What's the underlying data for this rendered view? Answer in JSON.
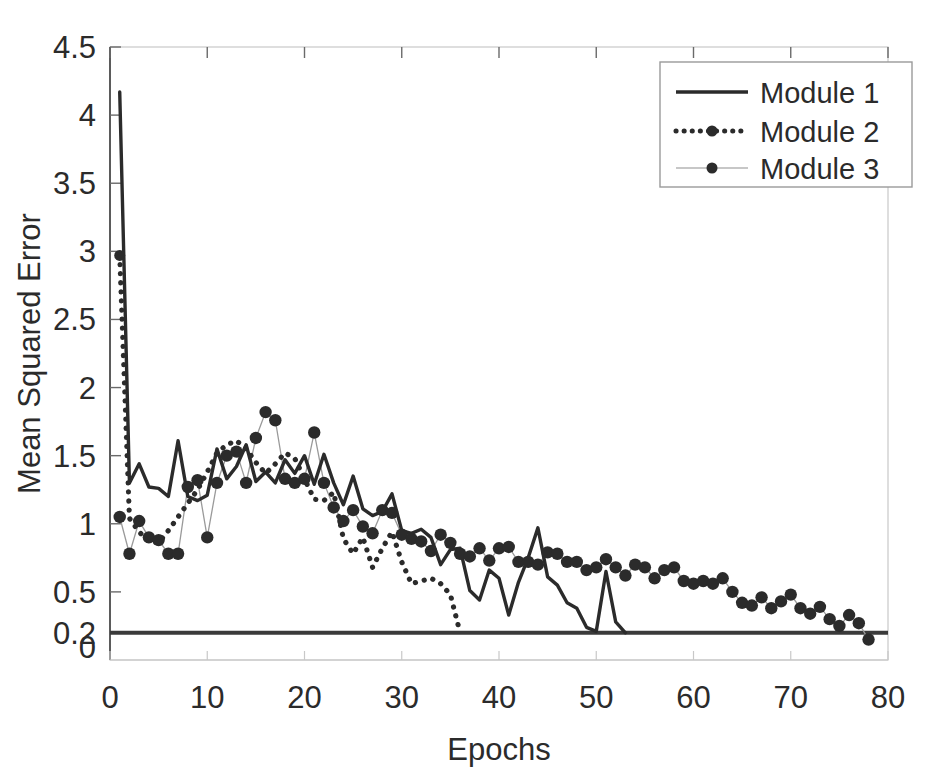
{
  "chart_data": {
    "type": "line",
    "title": "",
    "xlabel": "Epochs",
    "ylabel": "Mean Squared Error",
    "xlim": [
      0,
      80
    ],
    "ylim": [
      0,
      4.5
    ],
    "xticks": [
      0,
      10,
      20,
      30,
      40,
      50,
      60,
      70,
      80
    ],
    "xticklabels": [
      "0",
      "10",
      "20",
      "30",
      "40",
      "50",
      "60",
      "70",
      "80"
    ],
    "yticks": [
      0,
      0.2,
      0.5,
      1,
      1.5,
      2,
      2.5,
      3,
      3.5,
      4,
      4.5
    ],
    "yticklabels": [
      "0",
      "0.2",
      "0.5",
      "1",
      "1.5",
      "2",
      "2.5",
      "3",
      "3.5",
      "4",
      "4.5"
    ],
    "grid": false,
    "legend_position": "top-right",
    "goal_line": 0.2,
    "series": [
      {
        "name": "Module 1",
        "style": "solid",
        "marker": "none",
        "color": "#2b2b2b",
        "x": [
          1,
          2,
          3,
          4,
          5,
          6,
          7,
          8,
          9,
          10,
          11,
          12,
          13,
          14,
          15,
          16,
          17,
          18,
          19,
          20,
          21,
          22,
          23,
          24,
          25,
          26,
          27,
          28,
          29,
          30,
          31,
          32,
          33,
          34,
          35,
          36,
          37,
          38,
          39,
          40,
          41,
          42,
          43,
          44,
          45,
          46,
          47,
          48,
          49,
          50,
          51,
          52,
          53
        ],
        "values": [
          4.17,
          1.3,
          1.44,
          1.27,
          1.26,
          1.2,
          1.61,
          1.2,
          1.17,
          1.21,
          1.55,
          1.33,
          1.42,
          1.58,
          1.31,
          1.38,
          1.3,
          1.47,
          1.37,
          1.5,
          1.29,
          1.51,
          1.3,
          1.14,
          1.35,
          1.11,
          1.06,
          1.09,
          1.22,
          0.95,
          0.93,
          0.96,
          0.9,
          0.7,
          0.81,
          0.82,
          0.51,
          0.44,
          0.66,
          0.6,
          0.33,
          0.57,
          0.75,
          0.97,
          0.61,
          0.55,
          0.42,
          0.38,
          0.24,
          0.21,
          0.65,
          0.28,
          0.2
        ]
      },
      {
        "name": "Module 2",
        "style": "dotted",
        "marker": "dot",
        "color": "#2b2b2b",
        "x": [
          1,
          2,
          3,
          4,
          5,
          6,
          7,
          8,
          9,
          10,
          11,
          12,
          13,
          14,
          15,
          16,
          17,
          18,
          19,
          20,
          21,
          22,
          23,
          24,
          25,
          26,
          27,
          28,
          29,
          30,
          31,
          32,
          33,
          34,
          35,
          36
        ],
        "values": [
          2.97,
          1.04,
          0.94,
          0.87,
          0.86,
          0.95,
          1.05,
          1.15,
          1.25,
          1.38,
          1.52,
          1.58,
          1.61,
          1.55,
          1.45,
          1.37,
          1.44,
          1.52,
          1.48,
          1.33,
          1.18,
          1.17,
          1.23,
          0.89,
          0.78,
          0.9,
          0.68,
          0.82,
          0.94,
          0.72,
          0.56,
          0.58,
          0.6,
          0.56,
          0.48,
          0.2
        ]
      },
      {
        "name": "Module 3",
        "style": "markers",
        "marker": "dot",
        "color": "#2b2b2b",
        "x": [
          1,
          2,
          3,
          4,
          5,
          6,
          7,
          8,
          9,
          10,
          11,
          12,
          13,
          14,
          15,
          16,
          17,
          18,
          19,
          20,
          21,
          22,
          23,
          24,
          25,
          26,
          27,
          28,
          29,
          30,
          31,
          32,
          33,
          34,
          35,
          36,
          37,
          38,
          39,
          40,
          41,
          42,
          43,
          44,
          45,
          46,
          47,
          48,
          49,
          50,
          51,
          52,
          53,
          54,
          55,
          56,
          57,
          58,
          59,
          60,
          61,
          62,
          63,
          64,
          65,
          66,
          67,
          68,
          69,
          70,
          71,
          72,
          73,
          74,
          75,
          76,
          77,
          78
        ],
        "values": [
          1.05,
          0.78,
          1.02,
          0.9,
          0.88,
          0.78,
          0.78,
          1.27,
          1.32,
          0.9,
          1.3,
          1.5,
          1.53,
          1.3,
          1.63,
          1.82,
          1.76,
          1.33,
          1.3,
          1.33,
          1.67,
          1.3,
          1.12,
          1.02,
          1.1,
          0.98,
          0.93,
          1.1,
          1.08,
          0.92,
          0.89,
          0.87,
          0.8,
          0.92,
          0.86,
          0.78,
          0.76,
          0.82,
          0.73,
          0.82,
          0.83,
          0.72,
          0.72,
          0.7,
          0.79,
          0.78,
          0.72,
          0.72,
          0.66,
          0.68,
          0.74,
          0.68,
          0.62,
          0.7,
          0.68,
          0.6,
          0.66,
          0.68,
          0.58,
          0.56,
          0.58,
          0.56,
          0.6,
          0.5,
          0.42,
          0.4,
          0.46,
          0.38,
          0.43,
          0.48,
          0.38,
          0.34,
          0.39,
          0.3,
          0.25,
          0.33,
          0.27,
          0.15
        ]
      }
    ]
  },
  "legend": {
    "entries": [
      {
        "label": "Module 1",
        "style": "solid"
      },
      {
        "label": "Module 2",
        "style": "dotted-marker"
      },
      {
        "label": "Module 3",
        "style": "marker"
      }
    ]
  },
  "colors": {
    "series": "#2b2b2b",
    "axis": "#3a3a3a",
    "thin_connector": "#9a9a9a",
    "background": "#ffffff"
  }
}
